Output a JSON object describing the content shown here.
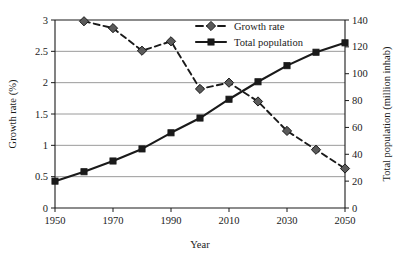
{
  "chart_data": {
    "type": "line",
    "title": "",
    "xlabel": "Year",
    "ylabel": "Growth rate (%)",
    "y2label": "Total population (million inhab)",
    "xlim": [
      1950,
      2050
    ],
    "ylim": [
      0,
      3
    ],
    "y2lim": [
      0,
      140
    ],
    "grid": "horizontal",
    "legend_position": "top-center",
    "x_ticks": [
      "1950",
      "1970",
      "1990",
      "2010",
      "2030",
      "2050"
    ],
    "x_tick_values": [
      1950,
      1970,
      1990,
      2010,
      2030,
      2050
    ],
    "y_ticks": [
      "0",
      "0.5",
      "1",
      "1.5",
      "2",
      "2.5",
      "3"
    ],
    "y_tick_values": [
      0,
      0.5,
      1,
      1.5,
      2,
      2.5,
      3
    ],
    "y2_ticks": [
      "0",
      "20",
      "40",
      "60",
      "80",
      "100",
      "120",
      "140"
    ],
    "y2_tick_values": [
      0,
      20,
      40,
      60,
      80,
      100,
      120,
      140
    ],
    "series": [
      {
        "name": "Growth rate",
        "axis": "left",
        "style": "dashed",
        "marker": "diamond",
        "color": "#1a1a1a",
        "x": [
          1960,
          1970,
          1980,
          1990,
          2000,
          2010,
          2020,
          2030,
          2040,
          2050
        ],
        "values": [
          2.98,
          2.87,
          2.51,
          2.66,
          1.9,
          2.0,
          1.7,
          1.23,
          0.93,
          0.63
        ]
      },
      {
        "name": "Total population",
        "axis": "right",
        "style": "solid",
        "marker": "square",
        "color": "#1a1a1a",
        "x": [
          1950,
          1960,
          1970,
          1980,
          1990,
          2000,
          2010,
          2020,
          2030,
          2040,
          2050
        ],
        "values": [
          20,
          27,
          35,
          44,
          56,
          67,
          81,
          94,
          106,
          116,
          123
        ]
      }
    ],
    "legend": [
      {
        "label": "Growth rate",
        "style": "dashed",
        "marker": "diamond"
      },
      {
        "label": "Total population",
        "style": "solid",
        "marker": "square"
      }
    ],
    "colors": {
      "axis": "#1a1a1a",
      "grid": "#808080",
      "series_growth": "#1a1a1a",
      "series_population": "#1a1a1a",
      "background": "#ffffff"
    }
  }
}
